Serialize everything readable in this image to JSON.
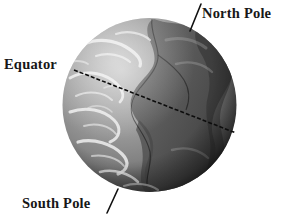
{
  "figure": {
    "background_color": "#ffffff",
    "width": 282,
    "height": 220
  },
  "globe": {
    "name": "earth-globe",
    "center_x": 149.5,
    "center_y": 105,
    "radius": 87,
    "ocean_color": "#9a9a9a",
    "land_color": "#555555",
    "cloud_color": "#e8e8e8",
    "shadow_color": "#1d1d1d",
    "highlight_color": "#c8c8c8"
  },
  "equator_line": {
    "name": "equator-line",
    "style": "dashed",
    "color": "#0d0d0d",
    "dash_pattern": "4 2",
    "stroke_width": 1.6,
    "x1": 74,
    "y1": 70,
    "x2": 236,
    "y2": 133
  },
  "labels": {
    "north_pole": {
      "text": "North Pole",
      "leader": {
        "x1": 190,
        "y1": 31,
        "x2": 201,
        "y2": 4
      }
    },
    "equator": {
      "text": "Equator",
      "leader": null
    },
    "south_pole": {
      "text": "South Pole",
      "leader": {
        "x1": 107,
        "y1": 213,
        "x2": 118,
        "y2": 189
      }
    }
  },
  "leader_line_style": {
    "color": "#111111",
    "stroke_width": 1.6
  }
}
